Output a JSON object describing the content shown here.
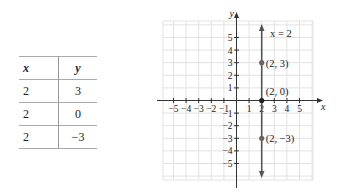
{
  "table": {
    "headers": [
      "x",
      "y"
    ],
    "rows": [
      [
        "2",
        "3"
      ],
      [
        "2",
        "0"
      ],
      [
        "2",
        "−3"
      ]
    ]
  },
  "graph": {
    "x_axis_label": "x",
    "y_axis_label": "y",
    "x_ticks": [
      "−5",
      "−4",
      "−3",
      "−2",
      "−1",
      "1",
      "2",
      "3",
      "4",
      "5"
    ],
    "y_ticks": [
      "5",
      "4",
      "3",
      "2",
      "1",
      "−1",
      "−2",
      "−3",
      "−4",
      "−5"
    ],
    "line_label": "x = 2",
    "points": [
      {
        "label": "(2, 3)",
        "x": 2,
        "y": 3
      },
      {
        "label": "(2, 0)",
        "x": 2,
        "y": 0
      },
      {
        "label": "(2, −3)",
        "x": 2,
        "y": -3
      }
    ],
    "line_color": "#555555",
    "grid_color": "#e2e2e2"
  }
}
